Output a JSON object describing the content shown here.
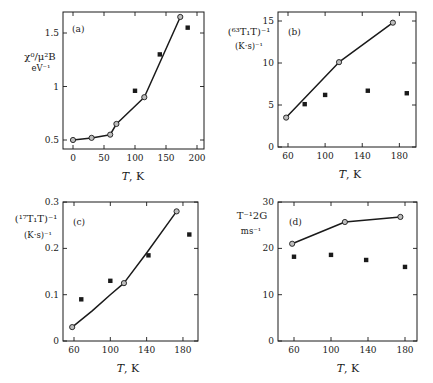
{
  "figure": {
    "panels": [
      {
        "id": "a",
        "label": "(a)",
        "xlabel_main": "T",
        "xlabel_unit": ", K",
        "ylabel_line1": "χ⁰/μ²B",
        "ylabel_line2": "eV⁻¹"
      },
      {
        "id": "b",
        "label": "(b)",
        "xlabel_main": "T",
        "xlabel_unit": ", K",
        "ylabel_line1": "(⁶³T₁T)⁻¹",
        "ylabel_line2": "(K·s)⁻¹"
      },
      {
        "id": "c",
        "label": "(c)",
        "xlabel_main": "T",
        "xlabel_unit": ", K",
        "ylabel_line1": "(¹⁷T₁T)⁻¹",
        "ylabel_line2": "(K·s)⁻¹"
      },
      {
        "id": "d",
        "label": "(d)",
        "xlabel_main": "T",
        "xlabel_unit": ", K",
        "ylabel_line1": "T⁻¹2G",
        "ylabel_line2": "ms⁻¹"
      }
    ]
  },
  "chart_data": [
    {
      "type": "line",
      "panel": "(a)",
      "title": "",
      "xlabel": "T, K",
      "ylabel": "χ⁰/μ_B² eV⁻¹",
      "xlim": [
        -16,
        210
      ],
      "ylim": [
        0.42,
        1.76
      ],
      "xticks": [
        0,
        50,
        100,
        150,
        200
      ],
      "yticks": [
        0.5,
        1,
        1.5
      ],
      "ytick_labels": [
        "0.5",
        "1",
        "1.5"
      ],
      "grid": false,
      "frame": {
        "x0": 63,
        "x1": 204,
        "y0": 12,
        "y1": 149
      },
      "map": {
        "x_at": [
          0,
          73
        ],
        "x_scale": 0.62,
        "y_at": [
          0.5,
          140
        ],
        "y_scale": 107
      },
      "series": [
        {
          "name": "calculated",
          "style": "line-open-circle",
          "x": [
            0,
            30,
            60,
            70,
            115,
            173
          ],
          "y": [
            0.5,
            0.52,
            0.55,
            0.65,
            0.9,
            1.65
          ]
        },
        {
          "name": "experiment",
          "style": "filled-square",
          "x": [
            100,
            140,
            185
          ],
          "y": [
            0.96,
            1.3,
            1.55
          ]
        }
      ]
    },
    {
      "type": "line",
      "panel": "(b)",
      "title": "",
      "xlabel": "T, K",
      "ylabel": "(⁶³T₁T)⁻¹ (K·s)⁻¹",
      "xlim": [
        49,
        198
      ],
      "ylim": [
        0,
        16
      ],
      "xticks": [
        60,
        100,
        140,
        180
      ],
      "yticks": [
        0,
        5,
        10,
        15
      ],
      "ytick_labels": [
        "0",
        "5",
        "10",
        "15"
      ],
      "grid": false,
      "frame": {
        "x0": 278,
        "x1": 416,
        "y0": 12,
        "y1": 147
      },
      "map": {
        "x_at": [
          60,
          288
        ],
        "x_scale": 0.928,
        "y_at": [
          0,
          147
        ],
        "y_scale": 8.4
      },
      "series": [
        {
          "name": "calculated",
          "style": "line-open-circle",
          "x": [
            58,
            115,
            173
          ],
          "y": [
            3.5,
            10.1,
            14.8
          ]
        },
        {
          "name": "experiment",
          "style": "filled-square",
          "x": [
            78,
            100,
            146,
            188
          ],
          "y": [
            5.1,
            6.2,
            6.7,
            6.4
          ]
        }
      ]
    },
    {
      "type": "line",
      "panel": "(c)",
      "title": "",
      "xlabel": "T, K",
      "ylabel": "(¹⁷T₁T)⁻¹ (K·s)⁻¹",
      "xlim": [
        48,
        197
      ],
      "ylim": [
        0,
        0.3
      ],
      "xticks": [
        60,
        100,
        140,
        180
      ],
      "yticks": [
        0,
        0.1,
        0.2,
        0.3
      ],
      "ytick_labels": [
        "0",
        "0.1",
        "0.2",
        "0.3"
      ],
      "grid": false,
      "frame": {
        "x0": 63,
        "x1": 198,
        "y0": 202,
        "y1": 341
      },
      "map": {
        "x_at": [
          60,
          74
        ],
        "x_scale": 0.908,
        "y_at": [
          0,
          341
        ],
        "y_scale": 463
      },
      "series": [
        {
          "name": "calculated",
          "style": "smooth-line-open-circle",
          "x": [
            58,
            80,
            100,
            115,
            140,
            173
          ],
          "y": [
            0.03,
            0.065,
            0.1,
            0.125,
            0.19,
            0.28
          ],
          "markers_at": [
            0,
            3,
            5
          ]
        },
        {
          "name": "experiment",
          "style": "filled-square",
          "x": [
            68,
            100,
            142,
            187
          ],
          "y": [
            0.09,
            0.13,
            0.185,
            0.23
          ]
        }
      ]
    },
    {
      "type": "line",
      "panel": "(d)",
      "title": "",
      "xlabel": "T, K",
      "ylabel": "T_2G⁻¹ ms⁻¹",
      "xlim": [
        43,
        193
      ],
      "ylim": [
        0,
        30
      ],
      "xticks": [
        60,
        100,
        140,
        180
      ],
      "yticks": [
        0,
        10,
        20,
        30
      ],
      "ytick_labels": [
        "0",
        "10",
        "20",
        "30"
      ],
      "grid": false,
      "frame": {
        "x0": 278,
        "x1": 417,
        "y0": 202,
        "y1": 341
      },
      "map": {
        "x_at": [
          60,
          294
        ],
        "x_scale": 0.925,
        "y_at": [
          0,
          341
        ],
        "y_scale": 4.63
      },
      "series": [
        {
          "name": "calculated",
          "style": "line-open-circle",
          "x": [
            58,
            115,
            175
          ],
          "y": [
            21,
            25.7,
            26.8
          ]
        },
        {
          "name": "experiment",
          "style": "filled-square",
          "x": [
            60,
            100,
            138,
            180
          ],
          "y": [
            18.2,
            18.6,
            17.5,
            16
          ]
        }
      ]
    }
  ],
  "colors": {
    "ink": "#1a1a1a",
    "marker_fill": "#bdbdbd",
    "background": "#ffffff"
  }
}
